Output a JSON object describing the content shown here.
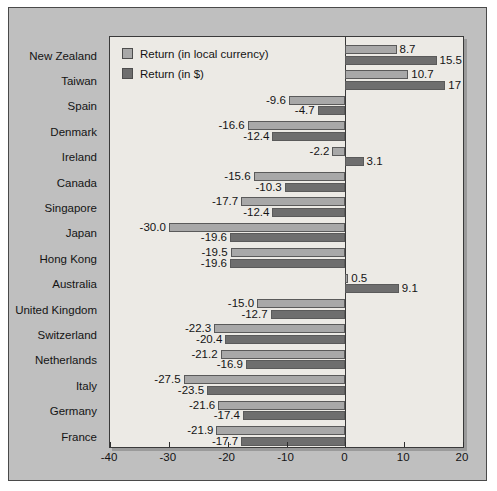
{
  "chart_data": {
    "type": "bar",
    "orientation": "horizontal",
    "title": "",
    "xlabel": "",
    "ylabel": "",
    "xlim": [
      -40,
      20
    ],
    "xticks": [
      -40,
      -30,
      -20,
      -10,
      0,
      10,
      20
    ],
    "xticklabels": [
      "-40",
      "-30",
      "-20",
      "-10",
      "0",
      "10",
      "20"
    ],
    "grid": false,
    "legend_position": "top-left",
    "categories": [
      "New Zealand",
      "Taiwan",
      "Spain",
      "Denmark",
      "Ireland",
      "Canada",
      "Singapore",
      "Japan",
      "Hong Kong",
      "Australia",
      "United Kingdom",
      "Switzerland",
      "Netherlands",
      "Italy",
      "Germany",
      "France"
    ],
    "series": [
      {
        "name": "Return (in local currency)",
        "color": "#a8a8a8",
        "values": [
          8.7,
          10.7,
          -9.6,
          -16.6,
          -2.2,
          -15.6,
          -17.7,
          -30.0,
          -19.5,
          0.5,
          -15.0,
          -22.3,
          -21.2,
          -27.5,
          -21.6,
          -21.9
        ],
        "labels": [
          "8.7",
          "10.7",
          "-9.6",
          "-16.6",
          "-2.2",
          "-15.6",
          "-17.7",
          "-30.0",
          "-19.5",
          "0.5",
          "-15.0",
          "-22.3",
          "-21.2",
          "-27.5",
          "-21.6",
          "-21.9"
        ]
      },
      {
        "name": "Return (in $)",
        "color": "#6e6e6e",
        "values": [
          15.5,
          17.0,
          -4.7,
          -12.4,
          3.1,
          -10.3,
          -12.4,
          -19.6,
          -19.6,
          9.1,
          -12.7,
          -20.4,
          -16.9,
          -23.5,
          -17.4,
          -17.7
        ],
        "labels": [
          "15.5",
          "17",
          "-4.7",
          "-12.4",
          "3.1",
          "-10.3",
          "-12.4",
          "-19.6",
          "-19.6",
          "9.1",
          "-12.7",
          "-20.4",
          "-16.9",
          "-23.5",
          "-17.4",
          "-17.7"
        ]
      }
    ]
  },
  "legend": {
    "items": [
      {
        "label": "Return (in local currency)",
        "color": "#a8a8a8"
      },
      {
        "label": "Return (in $)",
        "color": "#6e6e6e"
      }
    ]
  }
}
